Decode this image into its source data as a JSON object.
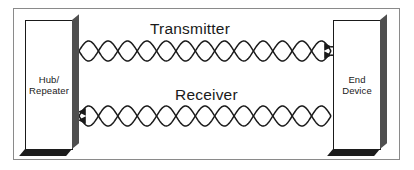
{
  "diagram": {
    "background_color": "#ffffff",
    "frame_color": "#8a8a8a",
    "line_color": "#1a1a1a",
    "shadow_side_color": "#4f4f4f",
    "shadow_bottom_color": "#1c1c1c"
  },
  "nodes": [
    {
      "id": "hub",
      "label": "Hub/\nRepeater",
      "shape": "3d-box",
      "x": 25,
      "y": 20,
      "width": 48,
      "height": 130
    },
    {
      "id": "end_device",
      "label": "End\nDevice",
      "shape": "3d-box",
      "x": 333,
      "y": 20,
      "width": 48,
      "height": 130
    }
  ],
  "connections": [
    {
      "id": "transmitter",
      "label": "Transmitter",
      "style": "twisted-pair",
      "from": "hub",
      "to": "end_device",
      "direction": "right",
      "arrow_at": "end_device",
      "twists": 6.5,
      "y_center": 51,
      "x_start": 79,
      "x_end": 331,
      "amplitude": 10
    },
    {
      "id": "receiver",
      "label": "Receiver",
      "style": "twisted-pair",
      "from": "end_device",
      "to": "hub",
      "direction": "left",
      "arrow_at": "hub",
      "twists": 6.5,
      "y_center": 116,
      "x_start": 79,
      "x_end": 331,
      "amplitude": 10
    }
  ]
}
